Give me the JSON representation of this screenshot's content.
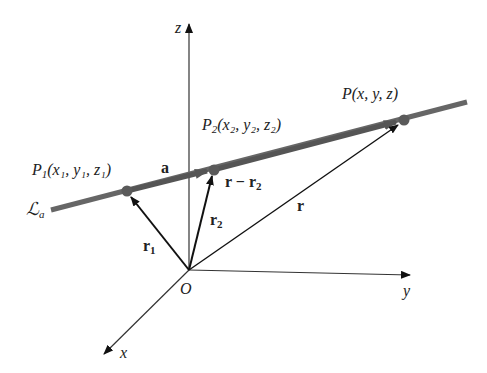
{
  "diagram": {
    "axes": {
      "z": "z",
      "y": "y",
      "x": "x",
      "origin": "O"
    },
    "line_label": {
      "main": "ℒ",
      "sub": "a"
    },
    "points": {
      "p1": {
        "name": "P",
        "sub": "1",
        "text": "(x₁, y₁, z₁)"
      },
      "p2": {
        "name": "P",
        "sub": "2",
        "text": "(x₂, y₂, z₂)"
      },
      "p": {
        "name": "P",
        "text": "(x, y, z)"
      }
    },
    "vectors": {
      "a": "a",
      "r1": "r",
      "r1_sub": "1",
      "r2": "r",
      "r2_sub": "2",
      "r": "r",
      "r_minus_r2": "r − r",
      "r_minus_r2_sub": "2"
    },
    "colors": {
      "line": "#666666",
      "point": "#5a5a5a",
      "vector": "#111111",
      "axis": "#333333"
    }
  }
}
